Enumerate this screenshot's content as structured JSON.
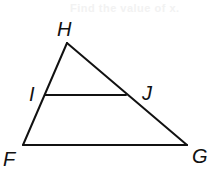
{
  "faint_header_text": "Find the value of x.",
  "figure": {
    "type": "triangle-with-parallel-segment",
    "stroke_color": "#111111",
    "vertices": {
      "H": {
        "label": "H",
        "x": 67,
        "y": 43
      },
      "F": {
        "label": "F",
        "x": 23,
        "y": 145
      },
      "G": {
        "label": "G",
        "x": 187,
        "y": 145
      },
      "I": {
        "label": "I",
        "x": 45,
        "y": 95
      },
      "J": {
        "label": "J",
        "x": 126,
        "y": 95
      }
    },
    "segments": [
      "HF",
      "HG",
      "FG",
      "IJ"
    ]
  }
}
